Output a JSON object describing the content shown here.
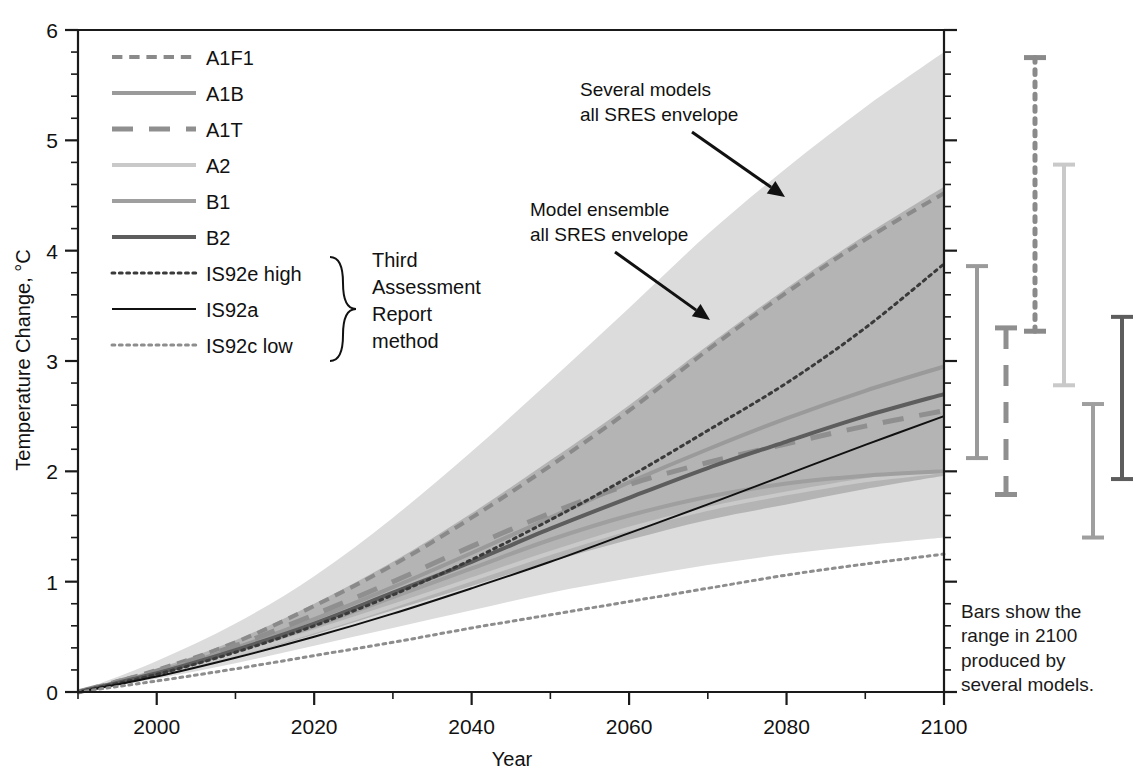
{
  "chart_data": {
    "type": "line",
    "title": "",
    "xlabel": "Year",
    "ylabel": "Temperature Change, °C",
    "xlim": [
      1990,
      2100
    ],
    "ylim": [
      0,
      6
    ],
    "xticks": [
      2000,
      2020,
      2040,
      2060,
      2080,
      2100
    ],
    "xtick_labels": [
      "2000",
      "2020",
      "2040",
      "2060",
      "2080",
      "2100"
    ],
    "yticks": [
      0,
      1,
      2,
      3,
      4,
      5,
      6
    ],
    "ytick_labels": [
      "0",
      "1",
      "2",
      "3",
      "4",
      "5",
      "6"
    ],
    "minor_tick_x_step": 10,
    "minor_tick_y_step": 0.2,
    "grid": false,
    "legend_position": "upper-left",
    "x": [
      1990,
      2000,
      2010,
      2020,
      2030,
      2040,
      2050,
      2060,
      2070,
      2080,
      2090,
      2100
    ],
    "series": [
      {
        "name": "A1F1",
        "style": "dashed",
        "color": "#8a8a8a",
        "width": 4,
        "values": [
          0.0,
          0.2,
          0.45,
          0.78,
          1.15,
          1.58,
          2.05,
          2.55,
          3.1,
          3.62,
          4.1,
          4.52
        ]
      },
      {
        "name": "A1B",
        "style": "solid",
        "color": "#9a9a9a",
        "width": 4,
        "values": [
          0.0,
          0.18,
          0.4,
          0.66,
          0.95,
          1.26,
          1.58,
          1.9,
          2.2,
          2.48,
          2.73,
          2.95
        ]
      },
      {
        "name": "A1T",
        "style": "longdash",
        "color": "#8f8f8f",
        "width": 5,
        "values": [
          0.0,
          0.19,
          0.42,
          0.7,
          1.0,
          1.32,
          1.62,
          1.88,
          2.08,
          2.25,
          2.41,
          2.55
        ]
      },
      {
        "name": "A2",
        "style": "solid",
        "color": "#c9c9c9",
        "width": 4,
        "values": [
          0.0,
          0.16,
          0.34,
          0.55,
          0.78,
          1.02,
          1.26,
          1.48,
          1.66,
          1.8,
          1.92,
          2.0
        ]
      },
      {
        "name": "B1",
        "style": "solid",
        "color": "#9f9f9f",
        "width": 4,
        "values": [
          0.0,
          0.17,
          0.37,
          0.6,
          0.86,
          1.12,
          1.38,
          1.6,
          1.77,
          1.89,
          1.96,
          2.0
        ]
      },
      {
        "name": "B2",
        "style": "solid",
        "color": "#5d5d5d",
        "width": 4,
        "values": [
          0.0,
          0.17,
          0.38,
          0.62,
          0.9,
          1.18,
          1.48,
          1.76,
          2.03,
          2.27,
          2.5,
          2.7
        ]
      },
      {
        "name": "IS92e high",
        "style": "dotted",
        "color": "#3a3a3a",
        "width": 3,
        "values": [
          0.0,
          0.16,
          0.36,
          0.6,
          0.88,
          1.2,
          1.56,
          1.95,
          2.37,
          2.8,
          3.3,
          3.88
        ]
      },
      {
        "name": "IS92a",
        "style": "solid",
        "color": "#111111",
        "width": 2,
        "values": [
          0.0,
          0.14,
          0.31,
          0.5,
          0.71,
          0.94,
          1.18,
          1.44,
          1.7,
          1.97,
          2.24,
          2.5
        ]
      },
      {
        "name": "IS92c low",
        "style": "dotted",
        "color": "#8d8d8d",
        "width": 3,
        "values": [
          0.0,
          0.1,
          0.21,
          0.33,
          0.45,
          0.58,
          0.7,
          0.82,
          0.94,
          1.06,
          1.16,
          1.25
        ]
      }
    ],
    "bands": [
      {
        "name": "Several models all SRES envelope",
        "fill": "#dcdcdc",
        "upper": [
          0.0,
          0.28,
          0.62,
          1.05,
          1.58,
          2.18,
          2.82,
          3.48,
          4.15,
          4.75,
          5.3,
          5.8
        ],
        "lower": [
          0.0,
          0.12,
          0.26,
          0.42,
          0.58,
          0.74,
          0.9,
          1.03,
          1.15,
          1.25,
          1.33,
          1.4
        ]
      },
      {
        "name": "Model ensemble all SRES envelope",
        "fill": "#b4b4b4",
        "upper": [
          0.0,
          0.21,
          0.47,
          0.8,
          1.18,
          1.62,
          2.1,
          2.6,
          3.14,
          3.66,
          4.14,
          4.58
        ],
        "lower": [
          0.0,
          0.15,
          0.32,
          0.52,
          0.74,
          0.96,
          1.18,
          1.38,
          1.56,
          1.7,
          1.84,
          1.96
        ]
      }
    ],
    "range_bars": {
      "note": "Bars show the range in 2100 produced by several models.",
      "bars": [
        {
          "name": "A1B",
          "style": "solid",
          "color": "#9a9a9a",
          "width": 4,
          "low": 2.12,
          "high": 3.86
        },
        {
          "name": "A1T",
          "style": "longdash",
          "color": "#8f8f8f",
          "width": 5,
          "low": 1.79,
          "high": 3.3
        },
        {
          "name": "A1F1",
          "style": "dotted",
          "color": "#8a8a8a",
          "width": 5,
          "low": 3.27,
          "high": 5.75
        },
        {
          "name": "A2",
          "style": "solid",
          "color": "#c9c9c9",
          "width": 4,
          "low": 2.78,
          "high": 4.78
        },
        {
          "name": "B1",
          "style": "solid",
          "color": "#9f9f9f",
          "width": 4,
          "low": 1.4,
          "high": 2.61
        },
        {
          "name": "B2",
          "style": "solid",
          "color": "#5d5d5d",
          "width": 4,
          "low": 1.93,
          "high": 3.4
        }
      ]
    },
    "annotations": [
      {
        "name": "several-models-annotation",
        "text_lines": [
          "Several models",
          "all SRES envelope"
        ]
      },
      {
        "name": "model-ensemble-annotation",
        "text_lines": [
          "Model ensemble",
          "all SRES envelope"
        ]
      }
    ]
  },
  "legend": {
    "items": [
      {
        "label": "A1F1"
      },
      {
        "label": "A1B"
      },
      {
        "label": "A1T"
      },
      {
        "label": "A2"
      },
      {
        "label": "B1"
      },
      {
        "label": "B2"
      },
      {
        "label": "IS92e high"
      },
      {
        "label": "IS92a"
      },
      {
        "label": "IS92c low"
      }
    ],
    "brace_note_lines": [
      "Third",
      "Assessment",
      "Report",
      "method"
    ]
  },
  "caption": {
    "lines": [
      "Bars show the",
      "range in 2100",
      "produced by",
      "several models."
    ]
  },
  "colors": {
    "outer_band": "#dcdcdc",
    "inner_band": "#b4b4b4",
    "axis": "#1a1a1a",
    "text": "#111111"
  }
}
